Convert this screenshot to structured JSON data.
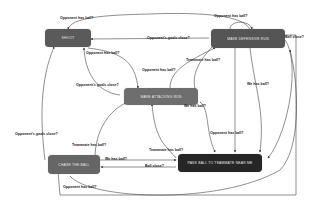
{
  "diagram": {
    "type": "state-machine",
    "nodes": [
      {
        "id": "shoot",
        "label": "Shoot",
        "color": "#5a5a5a"
      },
      {
        "id": "defensive",
        "label": "Make defensive run",
        "color": "#555555"
      },
      {
        "id": "attacking",
        "label": "Make attacking run",
        "color": "#6e6e6e"
      },
      {
        "id": "chase",
        "label": "Chase the ball",
        "color": "#666666"
      },
      {
        "id": "pass",
        "label": "Pass ball to teammate near me",
        "color": "#262626"
      }
    ],
    "edges": [
      {
        "from": "defensive",
        "to": "shoot",
        "label": "Opponent has ball?"
      },
      {
        "from": "defensive",
        "to": "shoot",
        "label": "Opponent's goals close?"
      },
      {
        "from": "shoot",
        "to": "attacking",
        "label": "Opponent has ball?"
      },
      {
        "from": "attacking",
        "to": "shoot",
        "label": "Opponent's goals close?"
      },
      {
        "from": "attacking",
        "to": "defensive",
        "label": "Opponent has ball?"
      },
      {
        "from": "defensive",
        "to": "attacking",
        "label": "Teammate has ball?"
      },
      {
        "from": "defensive",
        "to": "defensive",
        "label": "Opponent has ball?"
      },
      {
        "from": "defensive",
        "to": "pass",
        "label": "Ball close?"
      },
      {
        "from": "defensive",
        "to": "pass",
        "label": "We has ball?"
      },
      {
        "from": "attacking",
        "to": "pass",
        "label": "We has ball?"
      },
      {
        "from": "chase",
        "to": "attacking",
        "label": "Teammate has ball?"
      },
      {
        "from": "chase",
        "to": "shoot",
        "label": "Opponent's goals close?"
      },
      {
        "from": "chase",
        "to": "pass",
        "label": "We has ball?"
      },
      {
        "from": "pass",
        "to": "chase",
        "label": "Ball close?"
      },
      {
        "from": "pass",
        "to": "attacking",
        "label": "Teammate has ball?"
      },
      {
        "from": "pass",
        "to": "defensive",
        "label": "Opponent has ball?"
      },
      {
        "from": "chase",
        "to": "pass",
        "label": "Opponent has ball?"
      },
      {
        "from": "attacking",
        "to": "attacking",
        "label": "Opponent has ball?"
      }
    ]
  },
  "labels": {
    "l1": "Opponent has ball?",
    "l2": "Opponent's goals close?",
    "l3": "Opponent has ball?",
    "l4": "Ball close?",
    "l5": "Opponent has ball?",
    "l6": "Teammate has ball?",
    "l7": "Opponent has ball?",
    "l8": "Opponent's goals close?",
    "l9": "We has ball?",
    "l10": "Opponent has ball?",
    "l11": "Opponent's goals close?",
    "l12": "Teammate has ball?",
    "l13": "We has ball?",
    "l14": "Ball close?",
    "l15": "Teammate has ball?",
    "l16": "Opponent has ball?",
    "l17": "We has ball?"
  }
}
